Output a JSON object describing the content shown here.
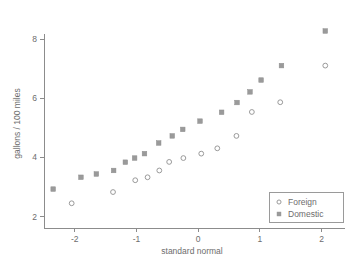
{
  "chart_data": {
    "type": "scatter",
    "title": "",
    "xlabel": "standard normal",
    "ylabel": "gallons / 100 miles",
    "xlim": [
      -2.45,
      2.25
    ],
    "ylim": [
      1.85,
      8.45
    ],
    "xticks": [
      -2,
      -1,
      0,
      1,
      2
    ],
    "xticklabels": [
      "-2",
      "-1",
      "0",
      "1",
      "2"
    ],
    "yticks": [
      2,
      4,
      6,
      8
    ],
    "yticklabels": [
      "2",
      "4",
      "6",
      "8"
    ],
    "grid": false,
    "legend_position": "lower right",
    "series": [
      {
        "name": "Foreign",
        "marker": "open-circle",
        "color": "#9a9a9a",
        "points": [
          [
            -2.05,
            2.45
          ],
          [
            -1.38,
            2.83
          ],
          [
            -1.02,
            3.23
          ],
          [
            -0.82,
            3.33
          ],
          [
            -0.63,
            3.56
          ],
          [
            -0.47,
            3.85
          ],
          [
            -0.24,
            3.98
          ],
          [
            0.05,
            4.13
          ],
          [
            0.31,
            4.31
          ],
          [
            0.62,
            4.73
          ],
          [
            0.87,
            5.54
          ],
          [
            1.33,
            5.87
          ],
          [
            2.06,
            7.11
          ]
        ]
      },
      {
        "name": "Domestic",
        "marker": "filled-square",
        "color": "#9a9a9a",
        "points": [
          [
            -2.35,
            2.93
          ],
          [
            -1.9,
            3.33
          ],
          [
            -1.65,
            3.44
          ],
          [
            -1.37,
            3.56
          ],
          [
            -1.18,
            3.84
          ],
          [
            -1.03,
            3.98
          ],
          [
            -0.87,
            4.13
          ],
          [
            -0.64,
            4.49
          ],
          [
            -0.42,
            4.73
          ],
          [
            -0.25,
            4.95
          ],
          [
            0.03,
            5.23
          ],
          [
            0.38,
            5.53
          ],
          [
            0.63,
            5.86
          ],
          [
            0.84,
            6.22
          ],
          [
            1.02,
            6.62
          ],
          [
            1.35,
            7.11
          ],
          [
            2.06,
            8.28
          ]
        ]
      }
    ]
  },
  "legend": {
    "entries": [
      {
        "label": "Foreign",
        "marker": "open-circle"
      },
      {
        "label": "Domestic",
        "marker": "filled-square"
      }
    ]
  },
  "colors": {
    "marker": "#9a9a9a",
    "axis": "#8c8c8c",
    "text": "#6d6d6d",
    "background": "#ffffff"
  }
}
